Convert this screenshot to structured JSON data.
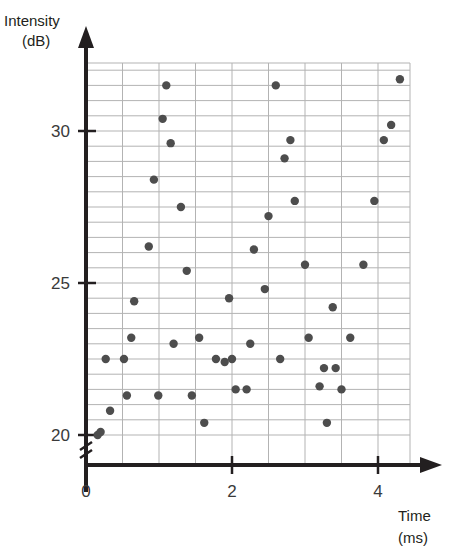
{
  "chart_data": {
    "type": "scatter",
    "title": "",
    "xlabel": "Time",
    "xunit": "(ms)",
    "ylabel": "Intensity",
    "yunit": "(dB)",
    "xlim": [
      0,
      4.45
    ],
    "ylim": [
      19.55,
      32.1
    ],
    "x_ticks": [
      0,
      2,
      4
    ],
    "x_tick_labels": [
      "0",
      "2",
      "4"
    ],
    "y_ticks": [
      20,
      25,
      30
    ],
    "y_tick_labels": [
      "20",
      "25",
      "30"
    ],
    "grid": true,
    "grid_x_step": 0.5,
    "grid_y_step": 0.5,
    "y_axis_break": true,
    "point_color": "#4d4d4d",
    "grid_color": "#b3b3b3",
    "axis_color": "#231f20",
    "n_points": 60,
    "points": [
      {
        "x": 0.16,
        "y": 20.0
      },
      {
        "x": 0.2,
        "y": 20.1
      },
      {
        "x": 0.27,
        "y": 22.5
      },
      {
        "x": 0.33,
        "y": 20.8
      },
      {
        "x": 0.52,
        "y": 22.5
      },
      {
        "x": 0.56,
        "y": 21.3
      },
      {
        "x": 0.62,
        "y": 23.2
      },
      {
        "x": 0.66,
        "y": 24.4
      },
      {
        "x": 0.86,
        "y": 26.2
      },
      {
        "x": 0.93,
        "y": 28.4
      },
      {
        "x": 0.99,
        "y": 21.3
      },
      {
        "x": 1.05,
        "y": 30.4
      },
      {
        "x": 1.1,
        "y": 31.5
      },
      {
        "x": 1.16,
        "y": 29.6
      },
      {
        "x": 1.2,
        "y": 23.0
      },
      {
        "x": 1.3,
        "y": 27.5
      },
      {
        "x": 1.38,
        "y": 25.4
      },
      {
        "x": 1.45,
        "y": 21.3
      },
      {
        "x": 1.55,
        "y": 23.2
      },
      {
        "x": 1.62,
        "y": 20.4
      },
      {
        "x": 1.78,
        "y": 22.5
      },
      {
        "x": 1.9,
        "y": 22.4
      },
      {
        "x": 1.96,
        "y": 24.5
      },
      {
        "x": 2.0,
        "y": 22.5
      },
      {
        "x": 2.05,
        "y": 21.5
      },
      {
        "x": 2.2,
        "y": 21.5
      },
      {
        "x": 2.25,
        "y": 23.0
      },
      {
        "x": 2.3,
        "y": 26.1
      },
      {
        "x": 2.45,
        "y": 24.8
      },
      {
        "x": 2.5,
        "y": 27.2
      },
      {
        "x": 2.6,
        "y": 31.5
      },
      {
        "x": 2.66,
        "y": 22.5
      },
      {
        "x": 2.72,
        "y": 29.1
      },
      {
        "x": 2.8,
        "y": 29.7
      },
      {
        "x": 2.86,
        "y": 27.7
      },
      {
        "x": 3.0,
        "y": 25.6
      },
      {
        "x": 3.05,
        "y": 23.2
      },
      {
        "x": 3.2,
        "y": 21.6
      },
      {
        "x": 3.26,
        "y": 22.2
      },
      {
        "x": 3.3,
        "y": 20.4
      },
      {
        "x": 3.38,
        "y": 24.2
      },
      {
        "x": 3.42,
        "y": 22.2
      },
      {
        "x": 3.5,
        "y": 21.5
      },
      {
        "x": 3.62,
        "y": 23.2
      },
      {
        "x": 3.8,
        "y": 25.6
      },
      {
        "x": 3.95,
        "y": 27.7
      },
      {
        "x": 4.08,
        "y": 29.7
      },
      {
        "x": 4.18,
        "y": 30.2
      },
      {
        "x": 4.3,
        "y": 31.7
      }
    ]
  }
}
